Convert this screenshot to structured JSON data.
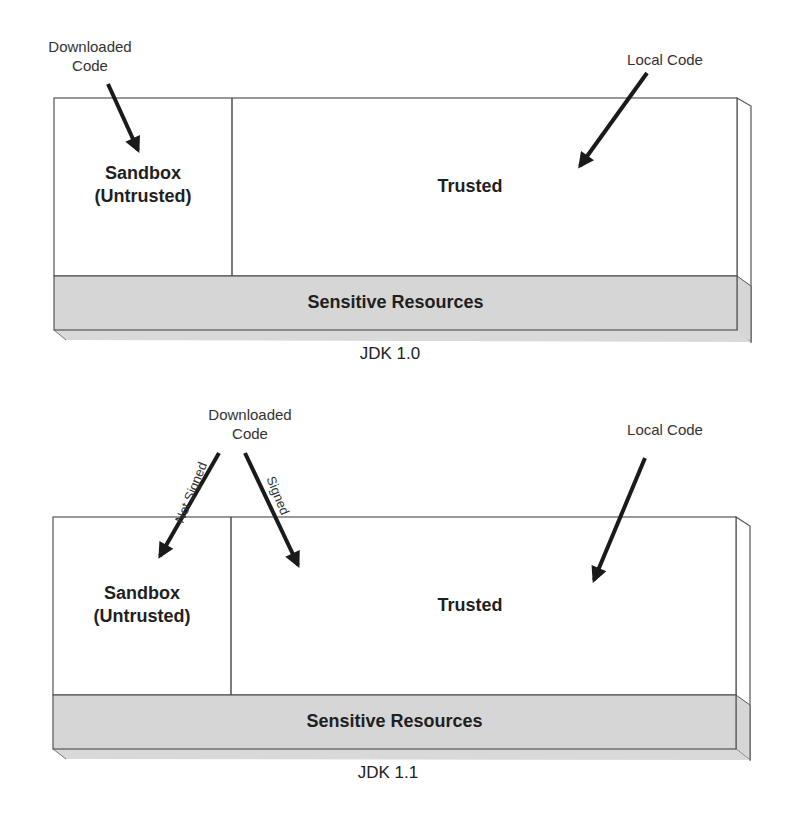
{
  "diagrams": [
    {
      "caption": "JDK 1.0",
      "downloaded_code_label_line1": "Downloaded",
      "downloaded_code_label_line2": "Code",
      "local_code_label": "Local Code",
      "sandbox_label_line1": "Sandbox",
      "sandbox_label_line2": "(Untrusted)",
      "trusted_label": "Trusted",
      "resources_label": "Sensitive Resources"
    },
    {
      "caption": "JDK 1.1",
      "downloaded_code_label_line1": "Downloaded",
      "downloaded_code_label_line2": "Code",
      "not_signed_label": "Not Signed",
      "signed_label": "Signed",
      "local_code_label": "Local Code",
      "sandbox_label_line1": "Sandbox",
      "sandbox_label_line2": "(Untrusted)",
      "trusted_label": "Trusted",
      "resources_label": "Sensitive Resources"
    }
  ],
  "colors": {
    "resources_fill": "#d6d6d6",
    "box_border": "#444444",
    "arrow": "#1a1a1a"
  }
}
